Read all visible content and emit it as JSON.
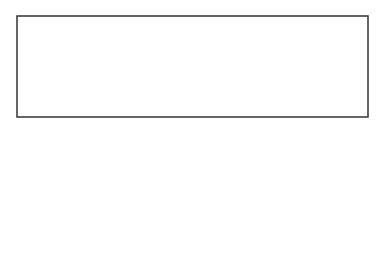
{
  "diagram": {
    "type": "supply-demand",
    "labels": {
      "y_axis": "P",
      "x_axis": "Q",
      "origin": "0",
      "price_eq": "P*",
      "qty_eq": "Q*",
      "supply": "S",
      "demand2": "D",
      "demand2_sub": "2",
      "demand1": "D",
      "demand1_sub": "1"
    },
    "colors": {
      "line": "#333333",
      "text": "#222222",
      "background": "#ffffff"
    }
  }
}
